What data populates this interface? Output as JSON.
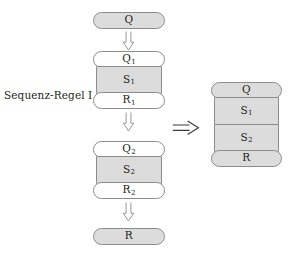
{
  "diagram": {
    "title": "Sequenz-Regel I",
    "background_color": "#ffffff",
    "stroke_color": "#8c8c8c",
    "text_color": "#231f20",
    "fill_gray": "#dcdcdc",
    "fill_white": "#fefefe",
    "label": {
      "text": "Sequenz-Regel I"
    },
    "premise": {
      "precondition": {
        "base": "Q",
        "sub": ""
      },
      "arrow_1": {
        "glyph": "down-double-arrow"
      },
      "block_1": {
        "pre": {
          "base": "Q",
          "sub": "1"
        },
        "stmt": {
          "base": "S",
          "sub": "1"
        },
        "post": {
          "base": "R",
          "sub": "1"
        }
      },
      "arrow_2": {
        "glyph": "down-double-arrow"
      },
      "block_2": {
        "pre": {
          "base": "Q",
          "sub": "2"
        },
        "stmt": {
          "base": "S",
          "sub": "2"
        },
        "post": {
          "base": "R",
          "sub": "2"
        }
      },
      "arrow_3": {
        "glyph": "down-double-arrow"
      },
      "postcondition": {
        "base": "R",
        "sub": ""
      }
    },
    "implies": {
      "glyph": "right-double-arrow",
      "symbol": "⟹"
    },
    "conclusion": {
      "pre": {
        "base": "Q",
        "sub": ""
      },
      "stmt_1": {
        "base": "S",
        "sub": "1"
      },
      "stmt_2": {
        "base": "S",
        "sub": "2"
      },
      "post": {
        "base": "R",
        "sub": ""
      }
    }
  }
}
